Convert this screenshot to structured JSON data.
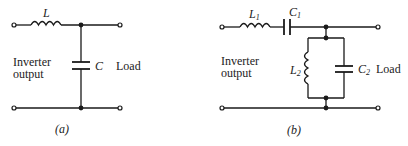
{
  "figures": [
    {
      "id": "a",
      "caption": "(a)",
      "components": [
        {
          "ref": "L",
          "type": "inductor",
          "position": "series"
        },
        {
          "ref": "C",
          "type": "capacitor",
          "position": "shunt"
        }
      ],
      "labels": {
        "inductor": "L",
        "capacitor": "C",
        "source_line1": "Inverter",
        "source_line2": "output",
        "load": "Load"
      }
    },
    {
      "id": "b",
      "caption": "(b)",
      "components": [
        {
          "ref": "L1",
          "type": "inductor",
          "position": "series"
        },
        {
          "ref": "C1",
          "type": "capacitor",
          "position": "series"
        },
        {
          "ref": "L2",
          "type": "inductor",
          "position": "shunt-parallel"
        },
        {
          "ref": "C2",
          "type": "capacitor",
          "position": "shunt-parallel"
        }
      ],
      "labels": {
        "inductor1": "L",
        "inductor1_sub": "1",
        "capacitor1": "C",
        "capacitor1_sub": "1",
        "inductor2": "L",
        "inductor2_sub": "2",
        "capacitor2": "C",
        "capacitor2_sub": "2",
        "source_line1": "Inverter",
        "source_line2": "output",
        "load": "Load"
      }
    }
  ]
}
